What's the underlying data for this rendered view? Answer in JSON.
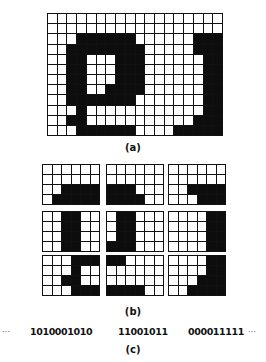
{
  "figure": {
    "panel_a": {
      "label": "(a)",
      "cols": 18,
      "rows": 12,
      "cells": [
        "000000000000000000",
        "000000000000000000",
        "000111111000000111",
        "001111111100000111",
        "001100011100000011",
        "001100011100000011",
        "001100011100000011",
        "001100111100000011",
        "001111111000000011",
        "000100000000000011",
        "001100000000000111",
        "000111111000011111"
      ]
    },
    "panel_b": {
      "label": "(b)",
      "tiles": [
        {
          "cells": [
            "000000",
            "000000",
            "001111",
            "011111"
          ]
        },
        {
          "cells": [
            "000000",
            "000000",
            "111000",
            "111100"
          ]
        },
        {
          "cells": [
            "000000",
            "000000",
            "001111",
            "000111"
          ]
        },
        {
          "cells": [
            "001100",
            "001100",
            "001100",
            "001100"
          ]
        },
        {
          "cells": [
            "011000",
            "011000",
            "011000",
            "111000"
          ]
        },
        {
          "cells": [
            "000011",
            "000011",
            "000011",
            "000011"
          ]
        },
        {
          "cells": [
            "000111",
            "000100",
            "001100",
            "000111"
          ]
        },
        {
          "cells": [
            "110000",
            "000000",
            "000000",
            "111100"
          ]
        },
        {
          "cells": [
            "000011",
            "000011",
            "000111",
            "001111"
          ]
        }
      ]
    },
    "panel_c": {
      "label": "(c)",
      "leading_ellipsis": "···",
      "codes": [
        "1010001010",
        "11001011",
        "000011111"
      ],
      "trailing_ellipsis": "···"
    }
  }
}
